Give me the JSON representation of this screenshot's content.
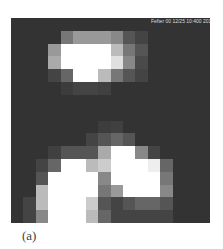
{
  "figure": {
    "label": "(a)",
    "timestamp_overlay": "Fefter 00 12/25 10:400 201",
    "grid": {
      "cols": 16,
      "rows": 16,
      "background_gray": 51,
      "pixels": [
        [
          51,
          51,
          51,
          51,
          51,
          51,
          51,
          51,
          51,
          51,
          51,
          51,
          51,
          51,
          51,
          51
        ],
        [
          51,
          51,
          51,
          51,
          119,
          153,
          153,
          153,
          136,
          85,
          68,
          51,
          51,
          51,
          51,
          51
        ],
        [
          51,
          51,
          51,
          153,
          255,
          255,
          255,
          255,
          187,
          119,
          85,
          51,
          51,
          51,
          51,
          51
        ],
        [
          51,
          51,
          51,
          170,
          255,
          255,
          255,
          255,
          224,
          136,
          74,
          51,
          51,
          51,
          51,
          51
        ],
        [
          51,
          51,
          51,
          68,
          102,
          255,
          255,
          187,
          119,
          85,
          68,
          51,
          51,
          51,
          51,
          51
        ],
        [
          51,
          51,
          51,
          51,
          60,
          68,
          68,
          64,
          51,
          51,
          51,
          51,
          51,
          51,
          51,
          51
        ],
        [
          51,
          51,
          51,
          51,
          51,
          51,
          51,
          51,
          51,
          51,
          51,
          51,
          51,
          51,
          51,
          51
        ],
        [
          51,
          51,
          51,
          51,
          51,
          51,
          51,
          51,
          51,
          51,
          51,
          51,
          51,
          51,
          51,
          51
        ],
        [
          51,
          51,
          51,
          51,
          51,
          51,
          51,
          61,
          64,
          51,
          51,
          51,
          51,
          51,
          51,
          51
        ],
        [
          51,
          51,
          51,
          51,
          51,
          51,
          68,
          85,
          102,
          85,
          51,
          51,
          51,
          51,
          51,
          51
        ],
        [
          51,
          51,
          51,
          64,
          85,
          85,
          85,
          170,
          255,
          255,
          136,
          68,
          51,
          51,
          51,
          51
        ],
        [
          51,
          51,
          68,
          102,
          255,
          255,
          187,
          204,
          255,
          255,
          255,
          238,
          102,
          51,
          51,
          51
        ],
        [
          51,
          51,
          85,
          255,
          255,
          255,
          255,
          136,
          255,
          255,
          255,
          255,
          119,
          51,
          51,
          51
        ],
        [
          51,
          51,
          187,
          255,
          255,
          255,
          255,
          119,
          153,
          255,
          255,
          255,
          136,
          51,
          51,
          51
        ],
        [
          51,
          68,
          187,
          255,
          255,
          255,
          204,
          85,
          68,
          85,
          102,
          102,
          85,
          51,
          51,
          51
        ],
        [
          51,
          68,
          136,
          255,
          255,
          255,
          187,
          102,
          68,
          68,
          68,
          68,
          68,
          51,
          51,
          51
        ]
      ]
    }
  }
}
